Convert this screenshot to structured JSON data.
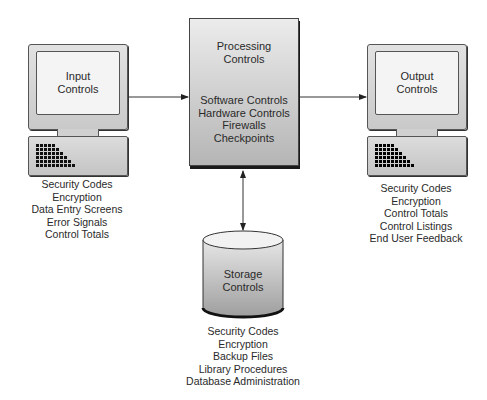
{
  "diagram": {
    "input": {
      "title_line1": "Input",
      "title_line2": "Controls",
      "items": [
        "Security Codes",
        "Encryption",
        "Data Entry Screens",
        "Error Signals",
        "Control Totals"
      ]
    },
    "processing": {
      "title_line1": "Processing",
      "title_line2": "Controls",
      "items": [
        "Software Controls",
        "Hardware Controls",
        "Firewalls",
        "Checkpoints"
      ]
    },
    "output": {
      "title_line1": "Output",
      "title_line2": "Controls",
      "items": [
        "Security Codes",
        "Encryption",
        "Control Totals",
        "Control Listings",
        "End User Feedback"
      ]
    },
    "storage": {
      "title_line1": "Storage",
      "title_line2": "Controls",
      "items": [
        "Security Codes",
        "Encryption",
        "Backup Files",
        "Library Procedures",
        "Database Administration"
      ]
    },
    "connections": [
      {
        "from": "input",
        "to": "processing",
        "type": "arrow"
      },
      {
        "from": "processing",
        "to": "output",
        "type": "arrow"
      },
      {
        "from": "processing",
        "to": "storage",
        "type": "bidirectional-arrow"
      }
    ]
  }
}
